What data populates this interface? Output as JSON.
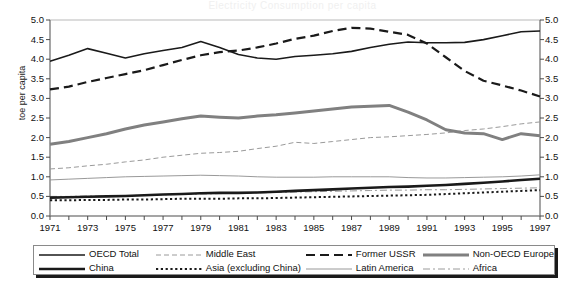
{
  "title": "Electricity Consumption per capita",
  "axes": {
    "ylabel": "toe per capita",
    "yticks": [
      "0.0",
      "0.5",
      "1.0",
      "1.5",
      "2.0",
      "2.5",
      "3.0",
      "3.5",
      "4.0",
      "4.5",
      "5.0"
    ],
    "xticks": [
      "1971",
      "1973",
      "1975",
      "1977",
      "1979",
      "1981",
      "1983",
      "1985",
      "1987",
      "1989",
      "1991",
      "1993",
      "1995",
      "1997"
    ]
  },
  "legend": {
    "items": [
      {
        "label": "OECD Total",
        "style": "solid-thin-black",
        "color": "#1a1a1a"
      },
      {
        "label": "China",
        "style": "solid-thick-black",
        "color": "#1a1a1a"
      },
      {
        "label": "Middle East",
        "style": "dashed-thin-gray",
        "color": "#9a9a9a"
      },
      {
        "label": "Asia (excluding China)",
        "style": "dotted-black",
        "color": "#1a1a1a"
      },
      {
        "label": "Former USSR",
        "style": "dashed-thick-black",
        "color": "#1a1a1a"
      },
      {
        "label": "Latin America",
        "style": "solid-hairline-gray",
        "color": "#8d8d8d"
      },
      {
        "label": "Non-OECD Europe",
        "style": "solid-thick-gray",
        "color": "#808080"
      },
      {
        "label": "Africa",
        "style": "dashdot-gray",
        "color": "#9a9a9a"
      }
    ]
  },
  "chart_data": {
    "type": "line",
    "title": "Electricity Consumption per capita",
    "xlabel": "",
    "ylabel": "toe per capita",
    "xlim": [
      1971,
      1997
    ],
    "ylim": [
      0.0,
      5.0
    ],
    "grid": false,
    "legend_position": "bottom",
    "x": [
      1971,
      1972,
      1973,
      1974,
      1975,
      1976,
      1977,
      1978,
      1979,
      1980,
      1981,
      1982,
      1983,
      1984,
      1985,
      1986,
      1987,
      1988,
      1989,
      1990,
      1991,
      1992,
      1993,
      1994,
      1995,
      1996,
      1997
    ],
    "series": [
      {
        "name": "OECD Total",
        "color": "#1a1a1a",
        "style": "solid-thin-black",
        "values": [
          3.95,
          4.1,
          4.27,
          4.15,
          4.03,
          4.14,
          4.22,
          4.3,
          4.45,
          4.3,
          4.12,
          4.03,
          4.0,
          4.07,
          4.1,
          4.14,
          4.2,
          4.3,
          4.38,
          4.44,
          4.42,
          4.42,
          4.43,
          4.5,
          4.6,
          4.7,
          4.72
        ]
      },
      {
        "name": "Former USSR",
        "color": "#1a1a1a",
        "style": "dashed-thick-black",
        "values": [
          3.23,
          3.3,
          3.42,
          3.52,
          3.62,
          3.72,
          3.85,
          3.98,
          4.1,
          4.18,
          4.22,
          4.3,
          4.4,
          4.52,
          4.6,
          4.72,
          4.8,
          4.78,
          4.7,
          4.62,
          4.4,
          4.05,
          3.7,
          3.45,
          3.33,
          3.2,
          3.05
        ]
      },
      {
        "name": "Non-OECD Europe",
        "color": "#808080",
        "style": "solid-thick-gray",
        "values": [
          1.83,
          1.9,
          2.0,
          2.1,
          2.22,
          2.32,
          2.4,
          2.48,
          2.55,
          2.52,
          2.5,
          2.55,
          2.58,
          2.63,
          2.68,
          2.73,
          2.78,
          2.8,
          2.82,
          2.65,
          2.45,
          2.2,
          2.12,
          2.1,
          1.95,
          2.1,
          2.05
        ]
      },
      {
        "name": "Middle East",
        "color": "#9a9a9a",
        "style": "dashed-thin-gray",
        "values": [
          1.2,
          1.23,
          1.28,
          1.32,
          1.38,
          1.43,
          1.5,
          1.55,
          1.6,
          1.62,
          1.65,
          1.72,
          1.78,
          1.88,
          1.85,
          1.9,
          1.95,
          2.0,
          2.02,
          2.05,
          2.08,
          2.12,
          2.18,
          2.22,
          2.28,
          2.35,
          2.4
        ]
      },
      {
        "name": "Latin America",
        "color": "#8d8d8d",
        "style": "solid-hairline-gray",
        "values": [
          0.92,
          0.94,
          0.96,
          0.98,
          1.0,
          1.01,
          1.02,
          1.03,
          1.04,
          1.03,
          1.02,
          1.0,
          0.99,
          0.99,
          0.99,
          1.0,
          1.0,
          1.0,
          1.0,
          0.98,
          0.97,
          0.97,
          0.98,
          0.99,
          1.0,
          1.02,
          1.05
        ]
      },
      {
        "name": "China",
        "color": "#1a1a1a",
        "style": "solid-thick-black",
        "values": [
          0.47,
          0.48,
          0.49,
          0.5,
          0.51,
          0.53,
          0.55,
          0.56,
          0.58,
          0.59,
          0.59,
          0.6,
          0.62,
          0.64,
          0.66,
          0.68,
          0.7,
          0.72,
          0.74,
          0.75,
          0.77,
          0.79,
          0.82,
          0.85,
          0.88,
          0.92,
          0.95
        ]
      },
      {
        "name": "Africa",
        "color": "#9a9a9a",
        "style": "dashdot-gray",
        "values": [
          0.5,
          0.5,
          0.51,
          0.51,
          0.52,
          0.53,
          0.54,
          0.55,
          0.56,
          0.57,
          0.58,
          0.59,
          0.6,
          0.61,
          0.62,
          0.63,
          0.64,
          0.65,
          0.66,
          0.66,
          0.67,
          0.67,
          0.68,
          0.69,
          0.7,
          0.71,
          0.72
        ]
      },
      {
        "name": "Asia (excluding China)",
        "color": "#1a1a1a",
        "style": "dotted-black",
        "values": [
          0.4,
          0.4,
          0.41,
          0.41,
          0.42,
          0.42,
          0.43,
          0.44,
          0.44,
          0.44,
          0.45,
          0.45,
          0.46,
          0.47,
          0.48,
          0.49,
          0.5,
          0.51,
          0.52,
          0.53,
          0.54,
          0.56,
          0.58,
          0.6,
          0.62,
          0.64,
          0.66
        ]
      }
    ]
  }
}
